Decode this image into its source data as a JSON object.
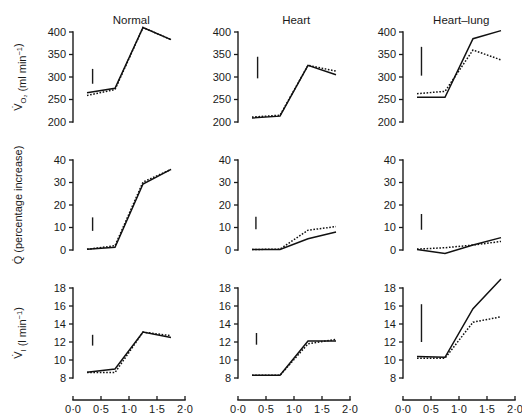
{
  "figure": {
    "columns": [
      {
        "key": "normal",
        "title": "Normal"
      },
      {
        "key": "heart",
        "title": "Heart"
      },
      {
        "key": "heartlung",
        "title": "Heart–lung"
      }
    ],
    "xaxis_title": "Time (min)",
    "row_labels": {
      "vo2": "V̇O2 (ml min-1)",
      "q": "Q̇ (percentage increase)",
      "vi": "V̇I (l min-1)"
    },
    "x_ticks": [
      "0·0",
      "0·5",
      "1·0",
      "1·5",
      "2·0"
    ],
    "x_tick_values": [
      0.0,
      0.5,
      1.0,
      1.5,
      2.0
    ],
    "y_ticks": {
      "vo2": [
        "400",
        "350",
        "300",
        "250",
        "200"
      ],
      "q": [
        "40",
        "30",
        "20",
        "10",
        "0"
      ],
      "vi": [
        "18",
        "16",
        "14",
        "12",
        "10",
        "8"
      ]
    }
  },
  "chart_data": {
    "type": "line",
    "title": "",
    "xlabel": "Time (min)",
    "xlim": [
      0.0,
      2.0
    ],
    "grid": false,
    "legend": "none",
    "series_styles": {
      "solid": "solid line (exercise)",
      "dotted": "dotted line (control)"
    },
    "error_bar_note": "vertical bar indicates standard error",
    "panels": [
      {
        "row": "VO2",
        "column": "Normal",
        "ylabel": "VO2 (ml min-1)",
        "ylim": [
          200,
          400
        ],
        "yticks": [
          200,
          250,
          300,
          350,
          400
        ],
        "x": [
          0.25,
          0.75,
          1.25,
          1.75
        ],
        "series": [
          {
            "name": "solid",
            "values": [
              265,
              275,
              410,
              383
            ]
          },
          {
            "name": "dotted",
            "values": [
              259,
              272,
              410,
              383
            ]
          }
        ],
        "error_bar": {
          "x": 0.35,
          "low": 285,
          "high": 318
        }
      },
      {
        "row": "VO2",
        "column": "Heart",
        "ylabel": "VO2 (ml min-1)",
        "ylim": [
          200,
          400
        ],
        "yticks": [
          200,
          250,
          300,
          350,
          400
        ],
        "x": [
          0.25,
          0.75,
          1.25,
          1.75
        ],
        "series": [
          {
            "name": "solid",
            "values": [
              209,
              213,
              326,
              305
            ]
          },
          {
            "name": "dotted",
            "values": [
              211,
              215,
              326,
              313
            ]
          }
        ],
        "error_bar": {
          "x": 0.35,
          "low": 297,
          "high": 345
        }
      },
      {
        "row": "VO2",
        "column": "Heart-lung",
        "ylabel": "VO2 (ml min-1)",
        "ylim": [
          200,
          400
        ],
        "yticks": [
          200,
          250,
          300,
          350,
          400
        ],
        "x": [
          0.25,
          0.75,
          1.25,
          1.75
        ],
        "series": [
          {
            "name": "solid",
            "values": [
              255,
              255,
              385,
              403
            ]
          },
          {
            "name": "dotted",
            "values": [
              263,
              268,
              360,
              338
            ]
          }
        ],
        "error_bar": {
          "x": 0.33,
          "low": 303,
          "high": 367
        }
      },
      {
        "row": "Q",
        "column": "Normal",
        "ylabel": "Q (percentage increase)",
        "ylim": [
          0,
          40
        ],
        "yticks": [
          0,
          10,
          20,
          30,
          40
        ],
        "x": [
          0.25,
          0.75,
          1.25,
          1.75
        ],
        "series": [
          {
            "name": "solid",
            "values": [
              0.3,
              1.2,
              29.3,
              35.8
            ]
          },
          {
            "name": "dotted",
            "values": [
              0.3,
              1.9,
              30.2,
              35.8
            ]
          }
        ],
        "error_bar": {
          "x": 0.35,
          "low": 8.5,
          "high": 14.5
        }
      },
      {
        "row": "Q",
        "column": "Heart",
        "ylabel": "Q (percentage increase)",
        "ylim": [
          0,
          40
        ],
        "yticks": [
          0,
          10,
          20,
          30,
          40
        ],
        "x": [
          0.25,
          0.75,
          1.25,
          1.75
        ],
        "series": [
          {
            "name": "solid",
            "values": [
              0.2,
              0.2,
              5.0,
              8.0
            ]
          },
          {
            "name": "dotted",
            "values": [
              0.2,
              0.4,
              8.8,
              10.4
            ]
          }
        ],
        "error_bar": {
          "x": 0.32,
          "low": 9.2,
          "high": 14.8
        }
      },
      {
        "row": "Q",
        "column": "Heart-lung",
        "ylabel": "Q (percentage increase)",
        "ylim": [
          0,
          40
        ],
        "yticks": [
          0,
          10,
          20,
          30,
          40
        ],
        "x": [
          0.25,
          0.75,
          1.25,
          1.75
        ],
        "series": [
          {
            "name": "solid",
            "values": [
              0.2,
              -1.5,
              2.2,
              5.5
            ]
          },
          {
            "name": "dotted",
            "values": [
              0.4,
              1.0,
              2.2,
              3.8
            ]
          }
        ],
        "error_bar": {
          "x": 0.33,
          "low": 9.0,
          "high": 16.0
        }
      },
      {
        "row": "VI",
        "column": "Normal",
        "ylabel": "VI (l min-1)",
        "ylim": [
          8,
          18
        ],
        "yticks": [
          8,
          10,
          12,
          14,
          16,
          18
        ],
        "x": [
          0.25,
          0.75,
          1.25,
          1.75
        ],
        "series": [
          {
            "name": "solid",
            "values": [
              8.65,
              9.0,
              13.1,
              12.5
            ]
          },
          {
            "name": "dotted",
            "values": [
              8.6,
              8.6,
              13.1,
              12.7
            ]
          }
        ],
        "error_bar": {
          "x": 0.35,
          "low": 11.6,
          "high": 12.8
        }
      },
      {
        "row": "VI",
        "column": "Heart",
        "ylabel": "VI (l min-1)",
        "ylim": [
          8,
          18
        ],
        "yticks": [
          8,
          10,
          12,
          14,
          16,
          18
        ],
        "x": [
          0.25,
          0.75,
          1.25,
          1.75
        ],
        "series": [
          {
            "name": "solid",
            "values": [
              8.3,
              8.3,
              12.1,
              12.1
            ]
          },
          {
            "name": "dotted",
            "values": [
              8.3,
              8.3,
              11.8,
              12.3
            ]
          }
        ],
        "error_bar": {
          "x": 0.33,
          "low": 11.7,
          "high": 13.0
        }
      },
      {
        "row": "VI",
        "column": "Heart-lung",
        "ylabel": "VI (l min-1)",
        "ylim": [
          8,
          18
        ],
        "yticks": [
          8,
          10,
          12,
          14,
          16,
          18
        ],
        "x": [
          0.25,
          0.75,
          1.25,
          1.75
        ],
        "series": [
          {
            "name": "solid",
            "values": [
              10.4,
              10.3,
              15.7,
              19.0
            ]
          },
          {
            "name": "dotted",
            "values": [
              10.2,
              10.2,
              14.2,
              14.8
            ]
          }
        ],
        "error_bar": {
          "x": 0.33,
          "low": 12.0,
          "high": 16.2
        }
      }
    ]
  }
}
